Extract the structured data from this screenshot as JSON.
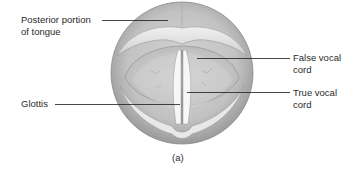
{
  "figure": {
    "caption": "(a)",
    "labels": [
      {
        "id": "posterior-tongue",
        "text": "Posterior portion\nof tongue",
        "side": "left"
      },
      {
        "id": "false-vocal-cord",
        "text": "False vocal\ncord",
        "side": "right"
      },
      {
        "id": "true-vocal-cord",
        "text": "True vocal\ncord",
        "side": "right"
      },
      {
        "id": "glottis",
        "text": "Glottis",
        "side": "left"
      }
    ]
  },
  "colors": {
    "background": "#ffffff",
    "tissue_light": "#e6e6e6",
    "tissue_mid": "#c4c4c4",
    "tissue_dark": "#8f8f8f",
    "cord_white": "#f6f6f6",
    "leader_line": "#1a1a1a"
  }
}
